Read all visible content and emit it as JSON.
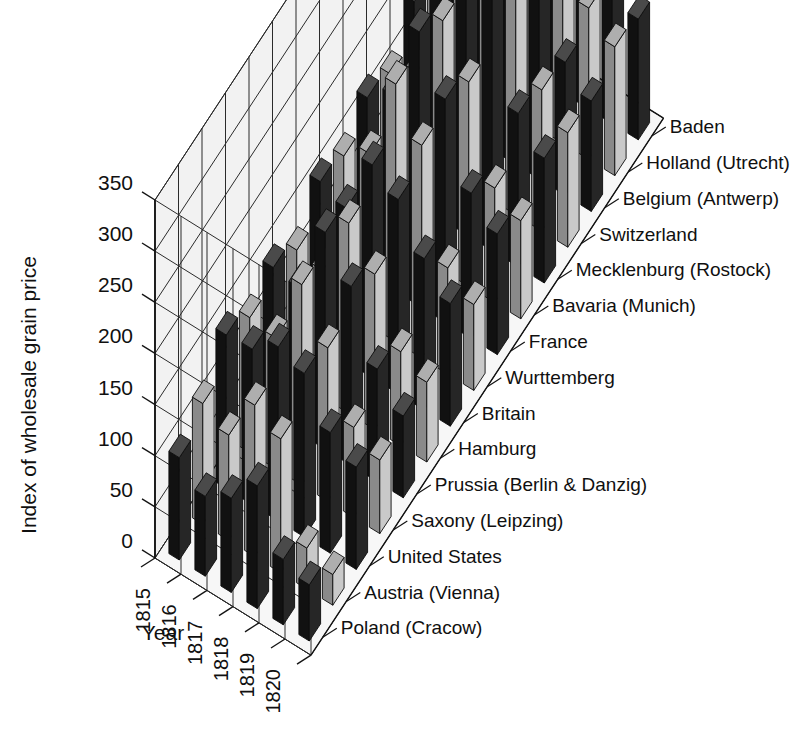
{
  "chart_data": {
    "type": "bar",
    "subtype": "3d-grouped-bar",
    "title": "",
    "xlabel": "Year",
    "ylabel": "Index of wholesale grain price",
    "zlabel": "",
    "ylim": [
      0,
      350
    ],
    "ytick_values": [
      0,
      50,
      100,
      150,
      200,
      250,
      300,
      350
    ],
    "ytick_labels": [
      "0",
      "50",
      "100",
      "150",
      "200",
      "250",
      "300",
      "350"
    ],
    "grid": true,
    "legend_position": "right-axis-inline",
    "categories": [
      "1815",
      "1816",
      "1817",
      "1818",
      "1819",
      "1820"
    ],
    "series_axis_labels": [
      "Poland (Cracow)",
      "Austria (Vienna)",
      "United States",
      "Saxony (Leipzing)",
      "Prussia (Berlin & Danzig)",
      "Hamburg",
      "Britain",
      "Wurttemberg",
      "France",
      "Bavaria (Munich)",
      "Mecklenburg (Rostock)",
      "Switzerland",
      "Belgium (Antwerp)",
      "Holland (Utrecht)",
      "Baden"
    ],
    "series": [
      {
        "name": "Poland (Cracow)",
        "shade": "dark",
        "values": [
          100,
          78,
          92,
          120,
          64,
          55
        ]
      },
      {
        "name": "Austria (Vienna)",
        "shade": "light",
        "values": [
          118,
          103,
          148,
          131,
          40,
          30
        ]
      },
      {
        "name": "United States",
        "shade": "dark",
        "values": [
          150,
          152,
          170,
          160,
          118,
          100
        ]
      },
      {
        "name": "Saxony (Leipzing)",
        "shade": "light",
        "values": [
          132,
          128,
          196,
          150,
          88,
          72
        ]
      },
      {
        "name": "Prussia (Berlin & Danzig)",
        "shade": "dark",
        "values": [
          146,
          142,
          212,
          175,
          110,
          80
        ]
      },
      {
        "name": "Hamburg",
        "shade": "light",
        "values": [
          128,
          124,
          186,
          152,
          92,
          78
        ]
      },
      {
        "name": "Britain",
        "shade": "dark",
        "values": [
          160,
          150,
          208,
          190,
          148,
          120
        ]
      },
      {
        "name": "Wurttemberg",
        "shade": "light",
        "values": [
          150,
          168,
          252,
          208,
          104,
          84
        ]
      },
      {
        "name": "France",
        "shade": "dark",
        "values": [
          172,
          190,
          268,
          218,
          142,
          118
        ]
      },
      {
        "name": "Bavaria (Munich)",
        "shade": "light",
        "values": [
          160,
          178,
          244,
          200,
          112,
          96
        ]
      },
      {
        "name": "Mecklenburg (Rostock)",
        "shade": "dark",
        "values": [
          196,
          216,
          330,
          252,
          150,
          122
        ]
      },
      {
        "name": "Switzerland",
        "shade": "light",
        "values": [
          188,
          208,
          300,
          238,
          138,
          112
        ]
      },
      {
        "name": "Belgium (Antwerp)",
        "shade": "dark",
        "values": [
          176,
          196,
          286,
          226,
          130,
          108
        ]
      },
      {
        "name": "Holland (Utrecht)",
        "shade": "light",
        "values": [
          206,
          228,
          322,
          258,
          148,
          126
        ]
      },
      {
        "name": "Baden",
        "shade": "dark",
        "values": [
          198,
          222,
          344,
          250,
          140,
          118
        ]
      }
    ]
  },
  "colors": {
    "bar_dark_front": "#262626",
    "bar_dark_side": "#111111",
    "bar_dark_top": "#4a4a4a",
    "bar_light_front": "#c9c9c9",
    "bar_light_side": "#8a8a8a",
    "bar_light_top": "#aeaeae",
    "wall": "#f2f2f2",
    "floor": "#f7f7f7",
    "grid": "#2b2b2b",
    "text": "#101010"
  }
}
